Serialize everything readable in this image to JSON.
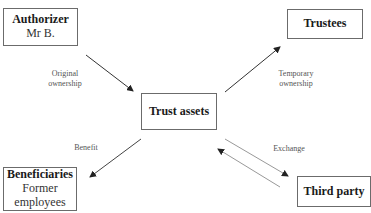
{
  "diagram": {
    "nodes": {
      "authorizer": {
        "title": "Authorizer",
        "subtitle": "Mr B."
      },
      "trustees": {
        "title": "Trustees"
      },
      "trust_assets": {
        "title": "Trust assets"
      },
      "beneficiaries": {
        "title": "Beneficiaries",
        "subtitle_line1": "Former",
        "subtitle_line2": "employees"
      },
      "third_party": {
        "title": "Third party"
      }
    },
    "edges": {
      "original_ownership": {
        "line1": "Original",
        "line2": "ownership",
        "from": "Authorizer",
        "to": "Trust assets"
      },
      "temporary_ownership": {
        "line1": "Temporary",
        "line2": "ownership",
        "from": "Trust assets",
        "to": "Trustees"
      },
      "benefit": {
        "label": "Benefit",
        "from": "Trust assets",
        "to": "Beneficiaries"
      },
      "exchange": {
        "label": "Exchange",
        "between": [
          "Trust assets",
          "Third party"
        ]
      }
    },
    "colors": {
      "box_border": "#6b6b6b",
      "arrow_dark": "#333333",
      "arrow_light": "#9a9a9a"
    }
  }
}
